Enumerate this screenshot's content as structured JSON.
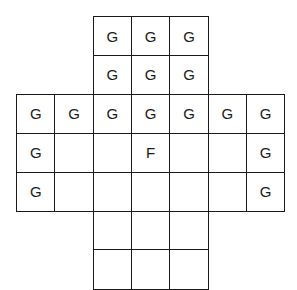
{
  "diagram": {
    "type": "cross-shaped grid",
    "origin": {
      "x": 16,
      "y": 16
    },
    "cell_width": 38.3,
    "cell_height": 38.9,
    "cells": [
      {
        "row": 0,
        "col": 2,
        "label": "G"
      },
      {
        "row": 0,
        "col": 3,
        "label": "G"
      },
      {
        "row": 0,
        "col": 4,
        "label": "G"
      },
      {
        "row": 1,
        "col": 2,
        "label": "G"
      },
      {
        "row": 1,
        "col": 3,
        "label": "G"
      },
      {
        "row": 1,
        "col": 4,
        "label": "G"
      },
      {
        "row": 2,
        "col": 0,
        "label": "G"
      },
      {
        "row": 2,
        "col": 1,
        "label": "G"
      },
      {
        "row": 2,
        "col": 2,
        "label": "G"
      },
      {
        "row": 2,
        "col": 3,
        "label": "G"
      },
      {
        "row": 2,
        "col": 4,
        "label": "G"
      },
      {
        "row": 2,
        "col": 5,
        "label": "G"
      },
      {
        "row": 2,
        "col": 6,
        "label": "G"
      },
      {
        "row": 3,
        "col": 0,
        "label": "G"
      },
      {
        "row": 3,
        "col": 1,
        "label": ""
      },
      {
        "row": 3,
        "col": 2,
        "label": ""
      },
      {
        "row": 3,
        "col": 3,
        "label": "F"
      },
      {
        "row": 3,
        "col": 4,
        "label": ""
      },
      {
        "row": 3,
        "col": 5,
        "label": ""
      },
      {
        "row": 3,
        "col": 6,
        "label": "G"
      },
      {
        "row": 4,
        "col": 0,
        "label": "G"
      },
      {
        "row": 4,
        "col": 1,
        "label": ""
      },
      {
        "row": 4,
        "col": 2,
        "label": ""
      },
      {
        "row": 4,
        "col": 3,
        "label": ""
      },
      {
        "row": 4,
        "col": 4,
        "label": ""
      },
      {
        "row": 4,
        "col": 5,
        "label": ""
      },
      {
        "row": 4,
        "col": 6,
        "label": "G"
      },
      {
        "row": 5,
        "col": 2,
        "label": ""
      },
      {
        "row": 5,
        "col": 3,
        "label": ""
      },
      {
        "row": 5,
        "col": 4,
        "label": ""
      },
      {
        "row": 6,
        "col": 2,
        "label": ""
      },
      {
        "row": 6,
        "col": 3,
        "label": ""
      },
      {
        "row": 6,
        "col": 4,
        "label": ""
      }
    ]
  }
}
